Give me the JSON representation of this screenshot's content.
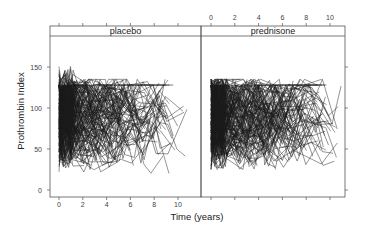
{
  "chart_data": {
    "type": "line",
    "title": "",
    "xlabel": "Time (years)",
    "ylabel": "Prothrombin Index",
    "xlim": [
      -0.5,
      11.5
    ],
    "ylim": [
      -5,
      185
    ],
    "grid": false,
    "legend": null,
    "layout": "trellis 1x2 panels with strip labels",
    "x_ticks": [
      0,
      2,
      4,
      6,
      8,
      10
    ],
    "y_ticks": [
      0,
      50,
      100,
      150
    ],
    "x_tick_position": "alternating: bottom labels under placebo, top labels over prednisone",
    "y_tick_position": "left labels, right ticks only",
    "panels": [
      {
        "name": "placebo",
        "strip_label": "placebo",
        "description": "individual patient trajectories (spaghetti plot); dense at time 0-2, values mostly 30-150, a few peaks near 175, lower tails to ~10",
        "n_subjects_approx": 250,
        "time_range": [
          0,
          10.8
        ],
        "value_range": [
          5,
          175
        ],
        "central_value_approx": 85,
        "max_ceiling_line": 128
      },
      {
        "name": "prednisone",
        "strip_label": "prednisone",
        "description": "individual patient trajectories (spaghetti plot); dense at time 0-2, values mostly 40-130, ceiling ~128, lower tails to ~25",
        "n_subjects_approx": 250,
        "time_range": [
          0,
          11
        ],
        "value_range": [
          25,
          135
        ],
        "central_value_approx": 85,
        "max_ceiling_line": 128
      }
    ]
  },
  "strips": {
    "left": "placebo",
    "right": "prednisone"
  },
  "axes": {
    "xlabel": "Time (years)",
    "ylabel": "Prothrombin Index",
    "x_tick_labels": [
      "0",
      "2",
      "4",
      "6",
      "8",
      "10"
    ],
    "y_tick_labels": [
      "0",
      "50",
      "100",
      "150"
    ]
  },
  "style": {
    "line_color": "#1a1a1a",
    "frame_color": "#555555",
    "strip_bg": "#ffffff",
    "background": "#ffffff"
  }
}
